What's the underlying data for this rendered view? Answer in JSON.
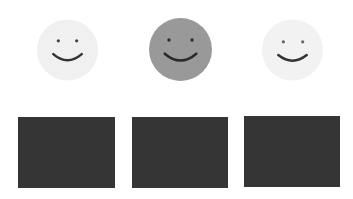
{
  "faces": [
    {
      "name": "smiley-1",
      "fill": "#f0f0f0",
      "feature": "#333333",
      "eye": "#444444",
      "selected": false
    },
    {
      "name": "smiley-2",
      "fill": "#999999",
      "feature": "#2a2a2a",
      "eye": "#2a2a2a",
      "selected": true
    },
    {
      "name": "smiley-3",
      "fill": "#f2f2f2",
      "feature": "#333333",
      "eye": "#666666",
      "selected": false
    }
  ],
  "tiles": [
    {
      "name": "tile-1",
      "color": "#353535"
    },
    {
      "name": "tile-2",
      "color": "#353535"
    },
    {
      "name": "tile-3",
      "color": "#353535"
    }
  ]
}
